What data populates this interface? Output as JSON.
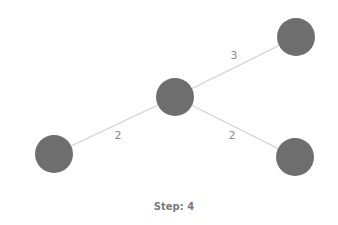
{
  "graph": {
    "node_color": "#6e6e6e",
    "edge_color": "#d0d0d0",
    "nodes": [
      {
        "id": "center",
        "x": 175,
        "y": 97,
        "r": 19
      },
      {
        "id": "top-right",
        "x": 296,
        "y": 37,
        "r": 19
      },
      {
        "id": "bottom-left",
        "x": 54,
        "y": 154,
        "r": 19
      },
      {
        "id": "bottom-right",
        "x": 295,
        "y": 157,
        "r": 19
      }
    ],
    "edges": [
      {
        "from": "center",
        "to": "top-right",
        "weight": "3",
        "label_x": 234,
        "label_y": 55
      },
      {
        "from": "center",
        "to": "bottom-left",
        "weight": "2",
        "label_x": 118,
        "label_y": 135
      },
      {
        "from": "center",
        "to": "bottom-right",
        "weight": "2",
        "label_x": 232,
        "label_y": 135
      }
    ]
  },
  "status": {
    "step_text": "Step: 4"
  }
}
